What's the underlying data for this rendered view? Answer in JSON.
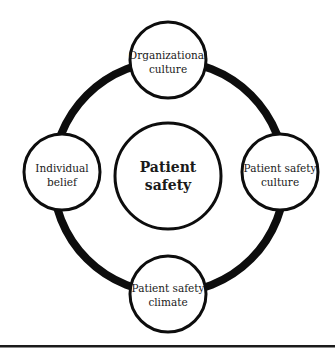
{
  "diagram": {
    "center": {
      "line1": "Patient",
      "line2": "safety"
    },
    "nodes": [
      {
        "id": "top",
        "line1": "Organizational",
        "line2": "culture"
      },
      {
        "id": "left",
        "line1": "Individual",
        "line2": "belief"
      },
      {
        "id": "right",
        "line1": "Patient safety",
        "line2": "culture"
      },
      {
        "id": "bottom",
        "line1": "Patient safety",
        "line2": "climate"
      }
    ],
    "colors": {
      "stroke": "#0d0d0d",
      "fill": "#ffffff",
      "text": "#1a1a1a"
    }
  }
}
